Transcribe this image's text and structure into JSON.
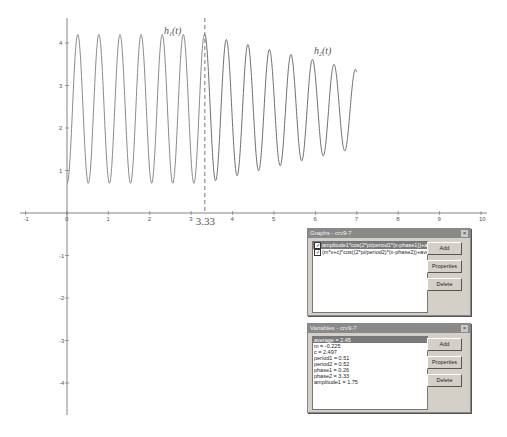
{
  "chart_data": {
    "type": "line",
    "title": "",
    "xlabel": "",
    "ylabel": "",
    "xlim": [
      -1,
      10
    ],
    "ylim": [
      -4.8,
      4.5
    ],
    "grid": false,
    "x_ticks": [
      -1,
      0,
      1,
      2,
      3,
      4,
      5,
      6,
      7,
      8,
      9,
      10
    ],
    "y_ticks": [
      4,
      3,
      2,
      1,
      -1,
      -2,
      -3,
      -4
    ],
    "origin_label": "0",
    "series": [
      {
        "name": "h1(t)",
        "label_main": "h",
        "label_sub": "1",
        "label_tail": "(t)",
        "formula": "amplitude1*cos(2*pi/period1*(x-phase1))+average",
        "domain": [
          0,
          3.33
        ],
        "color": "#8a8a8a"
      },
      {
        "name": "h2(t)",
        "label_main": "h",
        "label_sub": "2",
        "label_tail": "(t)",
        "formula": "(m*x+c)*cos((2*pi/period2)*(x-phase2))+average",
        "domain": [
          3.33,
          7
        ],
        "color": "#6f6f6f"
      }
    ],
    "annotations": [
      {
        "type": "vertical-dashed-line",
        "x": 3.33,
        "label": "3.33"
      }
    ],
    "parameters": {
      "average": 2.45,
      "m": -0.225,
      "c": 2.497,
      "period1": 0.51,
      "period2": 0.52,
      "phase1": 0.26,
      "phase2": 3.33,
      "amplitude1": 1.75
    }
  },
  "graphs_window": {
    "title": "Graphs - crv9-7",
    "close_icon": "close-icon",
    "items": [
      {
        "checked": true,
        "text": "amplitude1*cos(2*pi/period1*(x-phase1))+averag",
        "selected": true
      },
      {
        "checked": true,
        "text": "(m*x+c)*cos((2*pi/period2)*(x-phase2))+average (x>",
        "selected": false
      }
    ],
    "buttons": {
      "add": "Add",
      "properties": "Properties",
      "delete": "Delete"
    }
  },
  "variables_window": {
    "title": "Variables - crv9-7",
    "close_icon": "close-icon",
    "items": [
      {
        "text": "average = 2.45",
        "selected": true
      },
      {
        "text": "m = -0.225",
        "selected": false
      },
      {
        "text": "c = 2.497",
        "selected": false
      },
      {
        "text": "period1 = 0.51",
        "selected": false
      },
      {
        "text": "period2 = 0.52",
        "selected": false
      },
      {
        "text": "phase1 = 0.26",
        "selected": false
      },
      {
        "text": "phase2 = 3.33",
        "selected": false
      },
      {
        "text": "amplitude1 = 1.75",
        "selected": false
      }
    ],
    "buttons": {
      "add": "Add",
      "properties": "Properties",
      "delete": "Delete"
    }
  }
}
